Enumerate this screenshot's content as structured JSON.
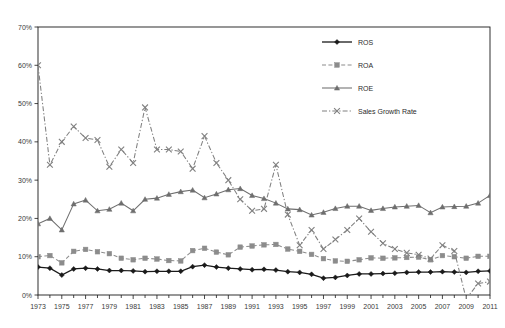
{
  "chart_data": {
    "type": "line",
    "title": "",
    "subtitle": "",
    "xlabel": "",
    "ylabel": "",
    "xlim": [
      1973,
      2011
    ],
    "ylim": [
      0,
      70
    ],
    "grid": false,
    "legend_position": "top-right-inside",
    "y_tick_labels": [
      "0%",
      "10%",
      "20%",
      "30%",
      "40%",
      "50%",
      "60%",
      "70%"
    ],
    "y_tick_values": [
      0,
      10,
      20,
      30,
      40,
      50,
      60,
      70
    ],
    "x_tick_labels": [
      "1973",
      "1975",
      "1977",
      "1979",
      "1981",
      "1983",
      "1985",
      "1987",
      "1989",
      "1991",
      "1993",
      "1995",
      "1997",
      "1999",
      "2001",
      "2003",
      "2005",
      "2007",
      "2009",
      "2011"
    ],
    "x_tick_values": [
      1973,
      1975,
      1977,
      1979,
      1981,
      1983,
      1985,
      1987,
      1989,
      1991,
      1993,
      1995,
      1997,
      1999,
      2001,
      2003,
      2005,
      2007,
      2009,
      2011
    ],
    "x": [
      1973,
      1974,
      1975,
      1976,
      1977,
      1978,
      1979,
      1980,
      1981,
      1982,
      1983,
      1984,
      1985,
      1986,
      1987,
      1988,
      1989,
      1990,
      1991,
      1992,
      1993,
      1994,
      1995,
      1996,
      1997,
      1998,
      1999,
      2000,
      2001,
      2002,
      2003,
      2004,
      2005,
      2006,
      2007,
      2008,
      2009,
      2010,
      2011
    ],
    "series": [
      {
        "name": "ROS",
        "color": "#1a1a1a",
        "marker": "diamond",
        "dash": "solid",
        "values": [
          7.3,
          7.0,
          5.2,
          6.8,
          7.0,
          6.8,
          6.4,
          6.4,
          6.3,
          6.1,
          6.2,
          6.2,
          6.2,
          7.4,
          7.8,
          7.3,
          7.0,
          6.8,
          6.6,
          6.7,
          6.5,
          6.1,
          5.9,
          5.4,
          4.4,
          4.6,
          5.1,
          5.5,
          5.5,
          5.6,
          5.7,
          5.9,
          6.0,
          6.0,
          6.1,
          6.0,
          5.9,
          6.2,
          6.3
        ]
      },
      {
        "name": "ROA",
        "color": "#8c8c8c",
        "marker": "square",
        "dash": "dashed",
        "values": [
          10.0,
          10.3,
          8.4,
          11.4,
          11.9,
          11.3,
          10.8,
          9.6,
          9.2,
          9.6,
          9.4,
          9.0,
          8.9,
          11.6,
          12.2,
          11.2,
          10.5,
          12.5,
          12.8,
          13.1,
          13.2,
          12.0,
          11.4,
          10.6,
          9.5,
          8.9,
          8.8,
          9.2,
          9.7,
          9.6,
          9.7,
          9.8,
          9.9,
          9.2,
          10.3,
          10.0,
          9.6,
          10.1,
          10.1
        ]
      },
      {
        "name": "ROE",
        "color": "#6e6e6e",
        "marker": "triangle",
        "dash": "solid",
        "values": [
          18.6,
          20.0,
          17.0,
          23.8,
          24.8,
          22.0,
          22.4,
          24.0,
          22.0,
          25.0,
          25.3,
          26.3,
          27.0,
          27.4,
          25.4,
          26.4,
          27.5,
          27.8,
          26.0,
          25.2,
          24.0,
          22.5,
          22.3,
          20.9,
          21.6,
          22.6,
          23.2,
          23.2,
          22.1,
          22.6,
          23.0,
          23.2,
          23.4,
          21.5,
          23.0,
          23.1,
          23.2,
          24.0,
          26.0
        ]
      },
      {
        "name": "Sales Growth Rate",
        "color": "#808080",
        "marker": "x",
        "dash": "dashdot",
        "values": [
          60.0,
          34.0,
          40.0,
          44.0,
          41.0,
          40.5,
          33.5,
          38.0,
          34.5,
          49.0,
          38.0,
          38.0,
          37.5,
          33.0,
          41.5,
          34.5,
          30.0,
          25.0,
          22.0,
          22.5,
          34.0,
          21.0,
          13.0,
          17.0,
          12.0,
          14.5,
          17.0,
          20.0,
          16.5,
          13.5,
          12.0,
          11.0,
          10.5,
          9.5,
          13.0,
          11.5,
          -1.0,
          3.0,
          3.5
        ]
      }
    ]
  },
  "legend": {
    "items": [
      {
        "label": "ROS"
      },
      {
        "label": "ROA"
      },
      {
        "label": "ROE"
      },
      {
        "label": "Sales Growth Rate"
      }
    ]
  }
}
